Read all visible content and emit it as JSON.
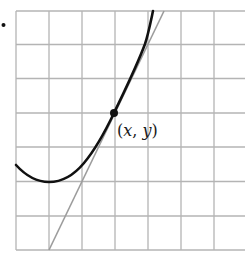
{
  "figure": {
    "bullet": "•",
    "point_label": {
      "open": "(",
      "x": "x",
      "sep": ", ",
      "y": "y",
      "close": ")"
    },
    "colors": {
      "grid": "#b4b4b4",
      "curve": "#111111",
      "tangent": "#9c9c9c",
      "background": "#ffffff"
    },
    "grid": {
      "columns_visible": 7,
      "rows": 7,
      "cell_px": 33.5
    },
    "elements": [
      {
        "name": "curve",
        "description": "convex curve with a local minimum near the lower-left, rising steeply to the top"
      },
      {
        "name": "tangent-line",
        "description": "straight gray tangent line touching the curve at point (x, y)"
      },
      {
        "name": "point-of-tangency",
        "label": "(x, y)"
      }
    ]
  }
}
